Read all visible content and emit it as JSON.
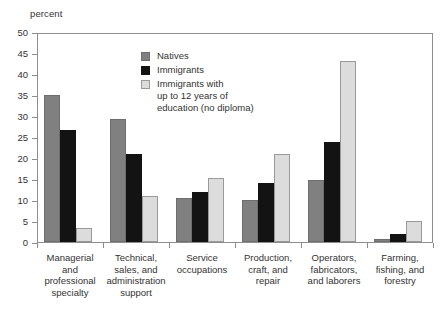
{
  "chart_data": {
    "type": "bar",
    "title": "",
    "xlabel": "",
    "ylabel": "percent",
    "ylim": [
      0,
      50
    ],
    "yticks": [
      0,
      5,
      10,
      15,
      20,
      25,
      30,
      35,
      40,
      45,
      50
    ],
    "grid": false,
    "legend_position": "inside-top-center",
    "categories": [
      "Managerial\nand\nprofessional\nspecialty",
      "Technical,\nsales, and\nadministration\nsupport",
      "Service\noccupations",
      "Production,\ncraft, and\nrepair",
      "Operators,\nfabricators,\nand laborers",
      "Farming,\nfishing, and\nforestry"
    ],
    "series": [
      {
        "name": "Natives",
        "color": "#808080",
        "values": [
          35.0,
          29.4,
          10.4,
          10.0,
          14.7,
          0.8
        ]
      },
      {
        "name": "Immigrants",
        "color": "#131313",
        "values": [
          26.7,
          21.0,
          12.0,
          14.0,
          23.9,
          2.0
        ]
      },
      {
        "name": "Immigrants with\nup to 12 years of\neducation (no diploma)",
        "color": "#dcdcdc",
        "values": [
          3.3,
          11.0,
          15.3,
          21.0,
          43.0,
          5.0
        ]
      }
    ]
  }
}
